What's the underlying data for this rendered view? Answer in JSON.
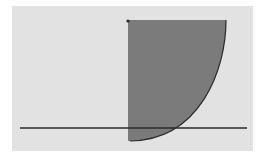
{
  "diagram": {
    "background_color": "#e2e2e2",
    "shape_fill": "#7b7b7b",
    "stroke_color": "#2a2a2a",
    "shape": "quarter-ellipse region bounded by vertical edge, top edge and convex curve",
    "baseline": {
      "x1": 20,
      "x2": 247,
      "y": 128
    }
  }
}
